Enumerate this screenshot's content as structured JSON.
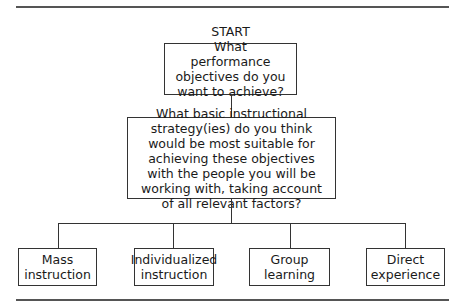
{
  "diagram": {
    "start_label": "START",
    "question_1": "What performance objectives do you want to achieve?",
    "question_2": "What basic instructional strategy(ies) do you think would be most suitable for achieving these objectives with the people you will be working with, taking account of all relevant factors?",
    "outcomes": [
      {
        "label": "Mass instruction"
      },
      {
        "label": "Individualized instruction"
      },
      {
        "label": "Group learning"
      },
      {
        "label": "Direct experience"
      }
    ]
  }
}
